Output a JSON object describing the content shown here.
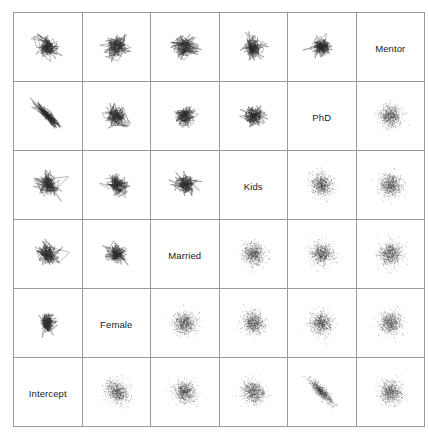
{
  "figure": {
    "type": "scatterplot-matrix",
    "n_variables": 6,
    "background_color": "#ffffff",
    "grid_line_color": "#9a9a9a",
    "ink_color": "#2b2b2b"
  },
  "variables": [
    {
      "index": 0,
      "label": "Intercept"
    },
    {
      "index": 1,
      "label": "Female"
    },
    {
      "index": 2,
      "label": "Married"
    },
    {
      "index": 3,
      "label": "Kids"
    },
    {
      "index": 4,
      "label": "PhD"
    },
    {
      "index": 5,
      "label": "Mentor"
    }
  ],
  "diagonal_labels": [
    "Mentor",
    "PhD",
    "Kids",
    "Married",
    "Female",
    "Intercept"
  ],
  "chart_data": {
    "type": "scatter",
    "title": "",
    "xlabel": "",
    "ylabel": "",
    "grid": true,
    "legend": "none",
    "variables": [
      "Intercept",
      "Female",
      "Married",
      "Kids",
      "PhD",
      "Mentor"
    ],
    "diagonal_order_top_to_bottom": [
      "Mentor",
      "PhD",
      "Kids",
      "Married",
      "Female",
      "Intercept"
    ],
    "panel_types": {
      "upper_left_triangle": "line-trace",
      "anti_diagonal": "variable-label",
      "lower_right_triangle": "point-cloud"
    },
    "cells": [
      {
        "row": 0,
        "col": 0,
        "kind": "trace",
        "x_var": "Intercept",
        "y_var": "Mentor",
        "correlation": -0.12,
        "spread": 0.62
      },
      {
        "row": 0,
        "col": 1,
        "kind": "trace",
        "x_var": "Female",
        "y_var": "Mentor",
        "correlation": 0.05,
        "spread": 0.66
      },
      {
        "row": 0,
        "col": 2,
        "kind": "trace",
        "x_var": "Married",
        "y_var": "Mentor",
        "correlation": -0.04,
        "spread": 0.68
      },
      {
        "row": 0,
        "col": 3,
        "kind": "trace",
        "x_var": "Kids",
        "y_var": "Mentor",
        "correlation": 0.02,
        "spread": 0.6
      },
      {
        "row": 0,
        "col": 4,
        "kind": "trace",
        "x_var": "PhD",
        "y_var": "Mentor",
        "correlation": -0.06,
        "spread": 0.58
      },
      {
        "row": 0,
        "col": 5,
        "kind": "label",
        "label": "Mentor"
      },
      {
        "row": 1,
        "col": 0,
        "kind": "trace",
        "x_var": "Intercept",
        "y_var": "PhD",
        "correlation": -0.88,
        "spread": 0.7
      },
      {
        "row": 1,
        "col": 1,
        "kind": "trace",
        "x_var": "Female",
        "y_var": "PhD",
        "correlation": -0.1,
        "spread": 0.64
      },
      {
        "row": 1,
        "col": 2,
        "kind": "trace",
        "x_var": "Married",
        "y_var": "PhD",
        "correlation": 0.03,
        "spread": 0.62
      },
      {
        "row": 1,
        "col": 3,
        "kind": "trace",
        "x_var": "Kids",
        "y_var": "PhD",
        "correlation": -0.02,
        "spread": 0.58
      },
      {
        "row": 1,
        "col": 4,
        "kind": "label",
        "label": "PhD"
      },
      {
        "row": 1,
        "col": 5,
        "kind": "cloud",
        "x_var": "PhD",
        "y_var": "Mentor",
        "correlation": -0.05,
        "spread": 0.52
      },
      {
        "row": 2,
        "col": 0,
        "kind": "trace",
        "x_var": "Intercept",
        "y_var": "Kids",
        "correlation": -0.18,
        "spread": 0.66
      },
      {
        "row": 2,
        "col": 1,
        "kind": "trace",
        "x_var": "Female",
        "y_var": "Kids",
        "correlation": -0.3,
        "spread": 0.6
      },
      {
        "row": 2,
        "col": 2,
        "kind": "trace",
        "x_var": "Married",
        "y_var": "Kids",
        "correlation": -0.12,
        "spread": 0.62
      },
      {
        "row": 2,
        "col": 3,
        "kind": "label",
        "label": "Kids"
      },
      {
        "row": 2,
        "col": 4,
        "kind": "cloud",
        "x_var": "Kids",
        "y_var": "PhD",
        "correlation": -0.06,
        "spread": 0.5
      },
      {
        "row": 2,
        "col": 5,
        "kind": "cloud",
        "x_var": "Kids",
        "y_var": "Mentor",
        "correlation": -0.04,
        "spread": 0.52
      },
      {
        "row": 3,
        "col": 0,
        "kind": "trace",
        "x_var": "Intercept",
        "y_var": "Married",
        "correlation": -0.2,
        "spread": 0.68
      },
      {
        "row": 3,
        "col": 1,
        "kind": "trace",
        "x_var": "Female",
        "y_var": "Married",
        "correlation": -0.08,
        "spread": 0.58
      },
      {
        "row": 3,
        "col": 2,
        "kind": "label",
        "label": "Married"
      },
      {
        "row": 3,
        "col": 3,
        "kind": "cloud",
        "x_var": "Married",
        "y_var": "Kids",
        "correlation": -0.08,
        "spread": 0.5
      },
      {
        "row": 3,
        "col": 4,
        "kind": "cloud",
        "x_var": "Married",
        "y_var": "PhD",
        "correlation": -0.03,
        "spread": 0.5
      },
      {
        "row": 3,
        "col": 5,
        "kind": "cloud",
        "x_var": "Married",
        "y_var": "Mentor",
        "correlation": -0.02,
        "spread": 0.52
      },
      {
        "row": 4,
        "col": 0,
        "kind": "trace",
        "x_var": "Intercept",
        "y_var": "Female",
        "correlation": -0.25,
        "spread": 0.6
      },
      {
        "row": 4,
        "col": 1,
        "kind": "label",
        "label": "Female"
      },
      {
        "row": 4,
        "col": 2,
        "kind": "cloud",
        "x_var": "Female",
        "y_var": "Married",
        "correlation": -0.05,
        "spread": 0.5
      },
      {
        "row": 4,
        "col": 3,
        "kind": "cloud",
        "x_var": "Female",
        "y_var": "Kids",
        "correlation": -0.06,
        "spread": 0.5
      },
      {
        "row": 4,
        "col": 4,
        "kind": "cloud",
        "x_var": "Female",
        "y_var": "PhD",
        "correlation": -0.02,
        "spread": 0.5
      },
      {
        "row": 4,
        "col": 5,
        "kind": "cloud",
        "x_var": "Female",
        "y_var": "Mentor",
        "correlation": -0.03,
        "spread": 0.52
      },
      {
        "row": 5,
        "col": 0,
        "kind": "label",
        "label": "Intercept"
      },
      {
        "row": 5,
        "col": 1,
        "kind": "cloud",
        "x_var": "Intercept",
        "y_var": "Female",
        "correlation": -0.22,
        "spread": 0.52
      },
      {
        "row": 5,
        "col": 2,
        "kind": "cloud",
        "x_var": "Intercept",
        "y_var": "Married",
        "correlation": -0.1,
        "spread": 0.5
      },
      {
        "row": 5,
        "col": 3,
        "kind": "cloud",
        "x_var": "Intercept",
        "y_var": "Kids",
        "correlation": -0.12,
        "spread": 0.5
      },
      {
        "row": 5,
        "col": 4,
        "kind": "cloud",
        "x_var": "Intercept",
        "y_var": "PhD",
        "correlation": -0.86,
        "spread": 0.56
      },
      {
        "row": 5,
        "col": 5,
        "kind": "cloud",
        "x_var": "Intercept",
        "y_var": "Mentor",
        "correlation": -0.08,
        "spread": 0.52
      }
    ]
  }
}
